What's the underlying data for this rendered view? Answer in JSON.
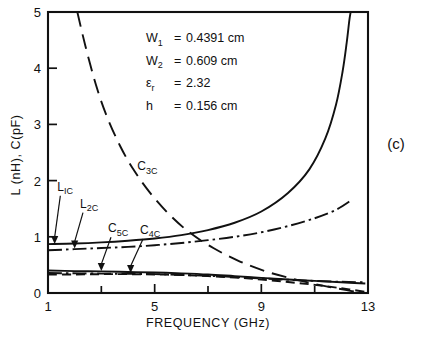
{
  "panel_label": "(c)",
  "annotations": [
    {
      "symbol": "W",
      "sub": "1",
      "eq": "=",
      "value": "0.4391 cm"
    },
    {
      "symbol": "W",
      "sub": "2",
      "eq": "=",
      "value": "0.609 cm"
    },
    {
      "symbol": "ε",
      "sub": "r",
      "eq": "=",
      "value": "2.32"
    },
    {
      "symbol": "h",
      "sub": "",
      "eq": "=",
      "value": "0.156 cm"
    }
  ],
  "chart_data": {
    "type": "line",
    "title": "",
    "xlabel": "FREQUENCY (GHz)",
    "ylabel": "L (nH), C(pF)",
    "xlim": [
      1,
      13
    ],
    "ylim": [
      0,
      5
    ],
    "xticks": [
      1,
      5,
      9,
      13
    ],
    "xticks_minor": [
      3,
      7,
      11
    ],
    "yticks": [
      0,
      1,
      2,
      3,
      4,
      5
    ],
    "grid": false,
    "legend": "inline-labels",
    "series": [
      {
        "name": "L1c",
        "label": "L",
        "label_sub": "IC",
        "style": "solid",
        "marker_at": [
          1.25,
          0.87
        ],
        "label_pos": [
          1.35,
          1.82
        ],
        "points": [
          [
            1.0,
            0.87
          ],
          [
            2.0,
            0.88
          ],
          [
            3.0,
            0.9
          ],
          [
            4.0,
            0.93
          ],
          [
            5.0,
            0.97
          ],
          [
            6.0,
            1.03
          ],
          [
            7.0,
            1.12
          ],
          [
            8.0,
            1.25
          ],
          [
            9.0,
            1.45
          ],
          [
            10.0,
            1.78
          ],
          [
            10.8,
            2.2
          ],
          [
            11.4,
            2.75
          ],
          [
            11.8,
            3.35
          ],
          [
            12.05,
            3.95
          ],
          [
            12.2,
            4.45
          ],
          [
            12.3,
            4.85
          ],
          [
            12.35,
            5.0
          ]
        ]
      },
      {
        "name": "L2c",
        "label": "L",
        "label_sub": "2C",
        "style": "dash-dot",
        "marker_at": [
          2.0,
          0.79
        ],
        "label_pos": [
          2.2,
          1.52
        ],
        "points": [
          [
            1.0,
            0.76
          ],
          [
            2.0,
            0.78
          ],
          [
            3.0,
            0.8
          ],
          [
            4.0,
            0.82
          ],
          [
            5.0,
            0.85
          ],
          [
            6.0,
            0.89
          ],
          [
            7.0,
            0.94
          ],
          [
            8.0,
            1.0
          ],
          [
            9.0,
            1.08
          ],
          [
            10.0,
            1.19
          ],
          [
            11.0,
            1.33
          ],
          [
            11.8,
            1.48
          ],
          [
            12.4,
            1.66
          ]
        ]
      },
      {
        "name": "C3c",
        "label": "C",
        "label_sub": "3C",
        "style": "long-dash",
        "marker_at": null,
        "label_pos": [
          4.35,
          2.18
        ],
        "points": [
          [
            2.1,
            5.0
          ],
          [
            2.4,
            4.4
          ],
          [
            2.8,
            3.7
          ],
          [
            3.2,
            3.15
          ],
          [
            3.7,
            2.62
          ],
          [
            4.2,
            2.2
          ],
          [
            4.8,
            1.8
          ],
          [
            5.5,
            1.42
          ],
          [
            6.3,
            1.08
          ],
          [
            7.2,
            0.8
          ],
          [
            8.2,
            0.56
          ],
          [
            9.2,
            0.38
          ],
          [
            10.2,
            0.25
          ],
          [
            11.2,
            0.14
          ],
          [
            12.2,
            0.05
          ],
          [
            12.7,
            0.01
          ]
        ]
      },
      {
        "name": "C5c",
        "label": "C",
        "label_sub": "5C",
        "style": "solid",
        "marker_at": [
          3.0,
          0.39
        ],
        "label_pos": [
          3.25,
          1.08
        ],
        "points": [
          [
            1.0,
            0.4
          ],
          [
            2.0,
            0.39
          ],
          [
            3.0,
            0.385
          ],
          [
            4.0,
            0.375
          ],
          [
            5.0,
            0.365
          ],
          [
            6.0,
            0.35
          ],
          [
            7.0,
            0.33
          ],
          [
            8.0,
            0.3
          ],
          [
            9.0,
            0.27
          ],
          [
            10.0,
            0.24
          ],
          [
            11.0,
            0.215
          ],
          [
            12.0,
            0.19
          ],
          [
            12.9,
            0.17
          ]
        ]
      },
      {
        "name": "C4c",
        "label": "C",
        "label_sub": "4C",
        "style": "dashed",
        "marker_at": [
          4.1,
          0.355
        ],
        "label_pos": [
          4.45,
          1.05
        ],
        "points": [
          [
            1.0,
            0.33
          ],
          [
            2.0,
            0.33
          ],
          [
            3.0,
            0.335
          ],
          [
            4.0,
            0.335
          ],
          [
            5.0,
            0.33
          ],
          [
            6.0,
            0.32
          ],
          [
            7.0,
            0.3
          ],
          [
            8.0,
            0.275
          ],
          [
            9.0,
            0.24
          ],
          [
            10.0,
            0.195
          ],
          [
            11.0,
            0.145
          ],
          [
            12.0,
            0.085
          ],
          [
            12.9,
            0.02
          ]
        ]
      },
      {
        "name": "C-aux",
        "label": "",
        "label_sub": "",
        "style": "dash-dot",
        "marker_at": null,
        "label_pos": null,
        "points": [
          [
            1.0,
            0.355
          ],
          [
            3.0,
            0.345
          ],
          [
            5.0,
            0.335
          ],
          [
            7.0,
            0.305
          ],
          [
            9.0,
            0.26
          ],
          [
            10.5,
            0.225
          ],
          [
            12.0,
            0.2
          ],
          [
            12.9,
            0.19
          ]
        ]
      }
    ]
  }
}
